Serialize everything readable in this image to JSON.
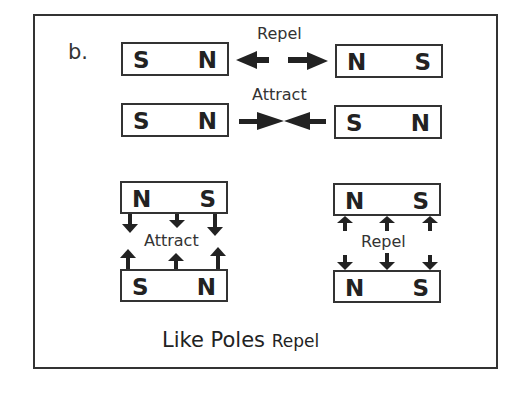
{
  "figure": {
    "label": "b.",
    "footer_main": "Like Poles",
    "footer_tail": "Repel"
  },
  "rows": {
    "repel_horizontal": {
      "caption": "Repel",
      "left_magnet": {
        "left_pole": "S",
        "right_pole": "N"
      },
      "right_magnet": {
        "left_pole": "N",
        "right_pole": "S"
      },
      "arrows": "pointing-outward"
    },
    "attract_horizontal": {
      "caption": "Attract",
      "left_magnet": {
        "left_pole": "S",
        "right_pole": "N"
      },
      "right_magnet": {
        "left_pole": "S",
        "right_pole": "N"
      },
      "arrows": "pointing-inward"
    }
  },
  "stacks": {
    "attract_vertical": {
      "caption": "Attract",
      "top_magnet": {
        "left_pole": "N",
        "right_pole": "S"
      },
      "bottom_magnet": {
        "left_pole": "S",
        "right_pole": "N"
      },
      "arrows": "pointing-toward-each-other"
    },
    "repel_vertical": {
      "caption": "Repel",
      "top_magnet": {
        "left_pole": "N",
        "right_pole": "S"
      },
      "bottom_magnet": {
        "left_pole": "N",
        "right_pole": "S"
      },
      "arrows": "pointing-away"
    }
  },
  "colors": {
    "ink": "#222222",
    "background": "#ffffff"
  }
}
